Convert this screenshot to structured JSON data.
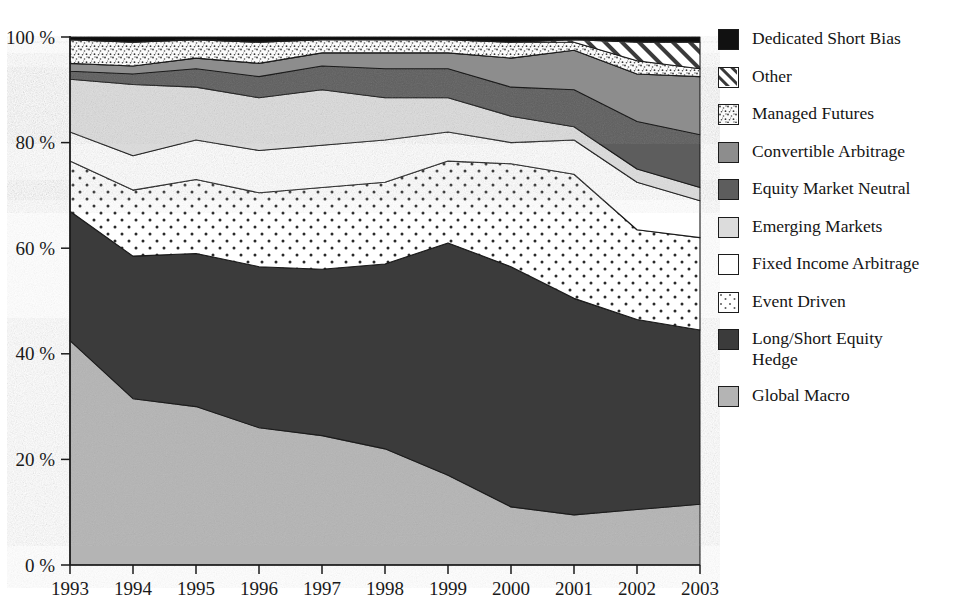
{
  "chart_data": {
    "type": "area",
    "stacked": true,
    "normalized_percent": true,
    "title": "",
    "xlabel": "",
    "ylabel": "",
    "grid": false,
    "legend_position": "right",
    "xlim": [
      1993,
      2003
    ],
    "ylim": [
      0,
      100
    ],
    "categories": [
      "1993",
      "1994",
      "1995",
      "1996",
      "1997",
      "1998",
      "1999",
      "2000",
      "2001",
      "2002",
      "2003"
    ],
    "x": [
      1993,
      1994,
      1995,
      1996,
      1997,
      1998,
      1999,
      2000,
      2001,
      2002,
      2003
    ],
    "y_ticks": [
      0,
      20,
      40,
      60,
      80,
      100
    ],
    "y_tick_labels": [
      "0 %",
      "20 %",
      "40 %",
      "60 %",
      "80 %",
      "100 %"
    ],
    "x_tick_labels": [
      "1993",
      "1994",
      "1995",
      "1996",
      "1997",
      "1998",
      "1999",
      "2000",
      "2001",
      "2002",
      "2003"
    ],
    "stack_order_bottom_to_top": [
      "Global Macro",
      "Long/Short Equity Hedge",
      "Event Driven",
      "Fixed Income Arbitrage",
      "Emerging Markets",
      "Equity Market Neutral",
      "Convertible Arbitrage",
      "Managed Futures",
      "Other",
      "Dedicated Short Bias"
    ],
    "series": [
      {
        "name": "Global Macro",
        "pattern": "solid",
        "color": "#b4b4b4",
        "values": [
          42.5,
          31.5,
          30.0,
          26.0,
          24.5,
          22.0,
          17.0,
          11.0,
          9.5,
          10.5,
          11.5
        ]
      },
      {
        "name": "Long/Short Equity Hedge",
        "pattern": "solid",
        "color": "#3b3b3b",
        "values": [
          24.5,
          27.0,
          29.0,
          30.5,
          31.5,
          35.0,
          44.0,
          45.5,
          41.0,
          36.0,
          33.0
        ]
      },
      {
        "name": "Event Driven",
        "pattern": "dots",
        "color": "#ffffff",
        "values": [
          9.5,
          12.5,
          14.0,
          14.0,
          15.5,
          15.5,
          15.5,
          19.5,
          23.5,
          17.0,
          17.5
        ]
      },
      {
        "name": "Fixed Income Arbitrage",
        "pattern": "solid",
        "color": "#ffffff",
        "values": [
          5.5,
          6.5,
          7.5,
          8.0,
          8.0,
          8.0,
          5.5,
          4.0,
          6.5,
          9.0,
          7.0
        ]
      },
      {
        "name": "Emerging Markets",
        "pattern": "solid",
        "color": "#dcdcdc",
        "values": [
          10.0,
          13.5,
          10.0,
          10.0,
          10.5,
          8.0,
          6.5,
          5.0,
          2.5,
          2.5,
          2.5
        ]
      },
      {
        "name": "Equity Market Neutral",
        "pattern": "solid",
        "color": "#5d5d5d",
        "values": [
          1.5,
          2.0,
          3.5,
          4.0,
          4.5,
          5.5,
          5.5,
          5.5,
          7.0,
          9.0,
          10.0
        ]
      },
      {
        "name": "Convertible Arbitrage",
        "pattern": "solid",
        "color": "#8d8d8d",
        "values": [
          1.5,
          1.5,
          2.0,
          2.5,
          2.5,
          3.0,
          3.0,
          5.5,
          7.5,
          9.0,
          11.0
        ]
      },
      {
        "name": "Managed Futures",
        "pattern": "stipple",
        "color": "#f2f2f2",
        "values": [
          4.5,
          4.5,
          3.5,
          4.0,
          2.5,
          2.5,
          2.5,
          3.0,
          1.5,
          2.5,
          1.5
        ]
      },
      {
        "name": "Other",
        "pattern": "hatch",
        "color": "#ffffff",
        "values": [
          0.0,
          0.0,
          0.0,
          0.0,
          0.0,
          0.0,
          0.0,
          0.0,
          0.5,
          3.5,
          5.0
        ]
      },
      {
        "name": "Dedicated Short Bias",
        "pattern": "solid",
        "color": "#111111",
        "values": [
          0.5,
          1.0,
          0.5,
          1.0,
          0.5,
          0.5,
          0.5,
          1.0,
          0.5,
          1.0,
          1.0
        ]
      }
    ]
  },
  "legend": {
    "items": [
      {
        "label": "Dedicated Short Bias",
        "pattern": "solid",
        "color": "#111111"
      },
      {
        "label": "Other",
        "pattern": "hatch",
        "color": "#ffffff"
      },
      {
        "label": "Managed Futures",
        "pattern": "stipple",
        "color": "#f4f4f4"
      },
      {
        "label": "Convertible Arbitrage",
        "pattern": "solid",
        "color": "#8d8d8d"
      },
      {
        "label": "Equity Market Neutral",
        "pattern": "solid",
        "color": "#5d5d5d"
      },
      {
        "label": "Emerging Markets",
        "pattern": "solid",
        "color": "#dcdcdc"
      },
      {
        "label": "Fixed Income Arbitrage",
        "pattern": "solid",
        "color": "#ffffff"
      },
      {
        "label": "Event Driven",
        "pattern": "dots",
        "color": "#ffffff"
      },
      {
        "label": "Long/Short Equity\nHedge",
        "pattern": "solid",
        "color": "#3b3b3b"
      },
      {
        "label": "Global Macro",
        "pattern": "solid",
        "color": "#b4b4b4"
      }
    ]
  },
  "axes": {
    "y_tick_labels": [
      "100 %",
      "80 %",
      "60 %",
      "40 %",
      "20 %",
      "0 %"
    ],
    "x_tick_labels": [
      "1993",
      "1994",
      "1995",
      "1996",
      "1997",
      "1998",
      "1999",
      "2000",
      "2001",
      "2002",
      "2003"
    ]
  }
}
